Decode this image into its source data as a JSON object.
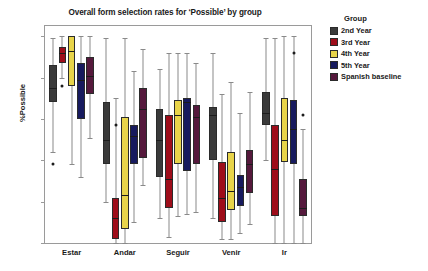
{
  "chart_data": {
    "type": "box",
    "title": "Overall form selection rates for ‘Possible’ by group",
    "xlabel": "",
    "ylabel": "%Possible",
    "ylim": [
      0,
      105
    ],
    "yticks": [
      0,
      20,
      40,
      60,
      80,
      100
    ],
    "grid": false,
    "legend_position": "right",
    "legend_title": "Group",
    "categories": [
      "Estar",
      "Andar",
      "Seguir",
      "Venir",
      "Ir"
    ],
    "series": [
      {
        "name": "2nd Year",
        "color": "#3a3a3a",
        "boxes": [
          {
            "category": "Estar",
            "whisker_low": 44,
            "q1": 68,
            "median": 75,
            "q3": 86,
            "whisker_high": 99,
            "outliers": [
              38
            ]
          },
          {
            "category": "Andar",
            "whisker_low": 20,
            "q1": 38,
            "median": 50,
            "q3": 68,
            "whisker_high": 99,
            "outliers": []
          },
          {
            "category": "Seguir",
            "whisker_low": 12,
            "q1": 32,
            "median": 50,
            "q3": 65,
            "whisker_high": 84,
            "outliers": []
          },
          {
            "category": "Venir",
            "whisker_low": 12,
            "q1": 40,
            "median": 62,
            "q3": 66,
            "whisker_high": 92,
            "outliers": []
          },
          {
            "category": "Ir",
            "whisker_low": 40,
            "q1": 57,
            "median": 63,
            "q3": 73,
            "whisker_high": 99,
            "outliers": []
          }
        ]
      },
      {
        "name": "3rd Year",
        "color": "#9e0d1a",
        "boxes": [
          {
            "category": "Estar",
            "whisker_low": 80,
            "q1": 87,
            "median": 92,
            "q3": 95,
            "whisker_high": 100,
            "outliers": [
              76
            ]
          },
          {
            "category": "Andar",
            "whisker_low": 0,
            "q1": 2,
            "median": 12,
            "q3": 22,
            "whisker_high": 70,
            "outliers": [
              57
            ]
          },
          {
            "category": "Seguir",
            "whisker_low": 3,
            "q1": 17,
            "median": 31,
            "q3": 62,
            "whisker_high": 92,
            "outliers": []
          },
          {
            "category": "Venir",
            "whisker_low": 2,
            "q1": 10,
            "median": 22,
            "q3": 39,
            "whisker_high": 72,
            "outliers": []
          },
          {
            "category": "Ir",
            "whisker_low": 0,
            "q1": 13,
            "median": 36,
            "q3": 57,
            "whisker_high": 99,
            "outliers": []
          }
        ]
      },
      {
        "name": "4th Year",
        "color": "#e8d44a",
        "boxes": [
          {
            "category": "Estar",
            "whisker_low": 38,
            "q1": 76,
            "median": 93,
            "q3": 100,
            "whisker_high": 100,
            "outliers": []
          },
          {
            "category": "Andar",
            "whisker_low": 0,
            "q1": 7,
            "median": 23,
            "q3": 61,
            "whisker_high": 99,
            "outliers": []
          },
          {
            "category": "Seguir",
            "whisker_low": 13,
            "q1": 38,
            "median": 62,
            "q3": 69,
            "whisker_high": 92,
            "outliers": []
          },
          {
            "category": "Venir",
            "whisker_low": 2,
            "q1": 16,
            "median": 25,
            "q3": 44,
            "whisker_high": 78,
            "outliers": []
          },
          {
            "category": "Ir",
            "whisker_low": 0,
            "q1": 39,
            "median": 50,
            "q3": 70,
            "whisker_high": 100,
            "outliers": []
          }
        ]
      },
      {
        "name": "5th Year",
        "color": "#171a5e",
        "boxes": [
          {
            "category": "Seguir",
            "whisker_low": 14,
            "q1": 35,
            "median": 68,
            "q3": 70,
            "whisker_high": 92,
            "outliers": []
          },
          {
            "category": "Estar",
            "whisker_low": 32,
            "q1": 60,
            "median": 79,
            "q3": 87,
            "whisker_high": 100,
            "outliers": []
          },
          {
            "category": "Andar",
            "whisker_low": 10,
            "q1": 38,
            "median": 52,
            "q3": 57,
            "whisker_high": 83,
            "outliers": []
          },
          {
            "category": "Venir",
            "whisker_low": 5,
            "q1": 18,
            "median": 27,
            "q3": 33,
            "whisker_high": 63,
            "outliers": []
          },
          {
            "category": "Ir",
            "whisker_low": 0,
            "q1": 38,
            "median": 55,
            "q3": 69,
            "whisker_high": 100,
            "outliers": [
              92
            ]
          }
        ]
      },
      {
        "name": "Spanish baseline",
        "color": "#55193c",
        "boxes": [
          {
            "category": "Estar",
            "whisker_low": 51,
            "q1": 72,
            "median": 81,
            "q3": 90,
            "whisker_high": 100,
            "outliers": []
          },
          {
            "category": "Andar",
            "whisker_low": 28,
            "q1": 41,
            "median": 65,
            "q3": 75,
            "whisker_high": 94,
            "outliers": []
          },
          {
            "category": "Seguir",
            "whisker_low": 15,
            "q1": 38,
            "median": 61,
            "q3": 67,
            "whisker_high": 87,
            "outliers": []
          },
          {
            "category": "Venir",
            "whisker_low": 9,
            "q1": 24,
            "median": 38,
            "q3": 45,
            "whisker_high": 73,
            "outliers": []
          },
          {
            "category": "Ir",
            "whisker_low": 0,
            "q1": 13,
            "median": 17,
            "q3": 31,
            "whisker_high": 55,
            "outliers": [
              62
            ]
          }
        ]
      }
    ]
  },
  "legend": {
    "title": "Group",
    "items": [
      {
        "label": "2nd Year",
        "color": "#3a3a3a"
      },
      {
        "label": "3rd Year",
        "color": "#9e0d1a"
      },
      {
        "label": "4th Year",
        "color": "#e8d44a"
      },
      {
        "label": "5th Year",
        "color": "#171a5e"
      },
      {
        "label": "Spanish baseline",
        "color": "#55193c"
      }
    ]
  }
}
